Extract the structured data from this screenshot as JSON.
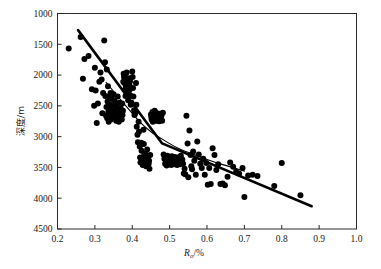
{
  "chart_data": {
    "type": "scatter",
    "title": "",
    "xlabel": "R_o/%",
    "xlabel_main": "R",
    "xlabel_sub": "o",
    "xlabel_tail": "/%",
    "ylabel": "深度/m",
    "xlim": [
      0.2,
      1.0
    ],
    "ylim": [
      1000,
      4500
    ],
    "y_inverted": true,
    "grid": false,
    "legend": "none",
    "xticks": [
      0.2,
      0.3,
      0.4,
      0.5,
      0.6,
      0.7,
      0.8,
      0.9,
      1.0
    ],
    "xticklabels": [
      "0.2",
      "0.3",
      "0.4",
      "0.5",
      "0.6",
      "0.7",
      "0.8",
      "0.9",
      "1.0"
    ],
    "yticks": [
      1000,
      1500,
      2000,
      2500,
      3000,
      3500,
      4000,
      4500
    ],
    "yticklabels": [
      "1000",
      "1500",
      "2000",
      "2500",
      "3000",
      "3500",
      "4000",
      "4500"
    ],
    "marker": {
      "shape": "circle",
      "color": "#000000",
      "size": 3.0
    },
    "series": [
      {
        "name": "samples",
        "x": [
          0.23,
          0.262,
          0.268,
          0.272,
          0.283,
          0.292,
          0.298,
          0.3,
          0.302,
          0.305,
          0.308,
          0.312,
          0.315,
          0.318,
          0.32,
          0.322,
          0.325,
          0.327,
          0.328,
          0.33,
          0.331,
          0.332,
          0.333,
          0.334,
          0.335,
          0.336,
          0.337,
          0.338,
          0.34,
          0.341,
          0.342,
          0.343,
          0.344,
          0.345,
          0.346,
          0.347,
          0.348,
          0.349,
          0.35,
          0.351,
          0.352,
          0.353,
          0.354,
          0.355,
          0.356,
          0.357,
          0.358,
          0.359,
          0.36,
          0.361,
          0.362,
          0.363,
          0.364,
          0.365,
          0.366,
          0.367,
          0.368,
          0.369,
          0.37,
          0.371,
          0.372,
          0.373,
          0.374,
          0.375,
          0.376,
          0.377,
          0.378,
          0.379,
          0.38,
          0.381,
          0.382,
          0.383,
          0.384,
          0.385,
          0.386,
          0.387,
          0.388,
          0.389,
          0.39,
          0.391,
          0.392,
          0.393,
          0.394,
          0.395,
          0.396,
          0.398,
          0.4,
          0.401,
          0.402,
          0.403,
          0.405,
          0.406,
          0.408,
          0.41,
          0.411,
          0.412,
          0.414,
          0.415,
          0.417,
          0.418,
          0.42,
          0.421,
          0.422,
          0.424,
          0.425,
          0.426,
          0.428,
          0.43,
          0.431,
          0.432,
          0.433,
          0.434,
          0.435,
          0.436,
          0.437,
          0.438,
          0.44,
          0.441,
          0.442,
          0.443,
          0.444,
          0.445,
          0.446,
          0.448,
          0.45,
          0.451,
          0.452,
          0.454,
          0.455,
          0.457,
          0.458,
          0.46,
          0.462,
          0.464,
          0.466,
          0.468,
          0.47,
          0.472,
          0.474,
          0.476,
          0.478,
          0.48,
          0.482,
          0.484,
          0.486,
          0.488,
          0.49,
          0.492,
          0.494,
          0.496,
          0.498,
          0.5,
          0.502,
          0.504,
          0.506,
          0.508,
          0.51,
          0.512,
          0.514,
          0.516,
          0.518,
          0.52,
          0.522,
          0.524,
          0.526,
          0.528,
          0.53,
          0.532,
          0.534,
          0.536,
          0.538,
          0.54,
          0.542,
          0.545,
          0.548,
          0.55,
          0.553,
          0.556,
          0.558,
          0.56,
          0.563,
          0.566,
          0.57,
          0.574,
          0.578,
          0.582,
          0.586,
          0.59,
          0.594,
          0.598,
          0.602,
          0.606,
          0.61,
          0.615,
          0.62,
          0.625,
          0.63,
          0.636,
          0.642,
          0.648,
          0.655,
          0.662,
          0.67,
          0.678,
          0.686,
          0.695,
          0.7,
          0.71,
          0.722,
          0.735,
          0.78,
          0.8,
          0.85
        ],
        "y": [
          1570,
          1380,
          2060,
          1740,
          1690,
          2230,
          2500,
          1880,
          2250,
          2780,
          2460,
          2110,
          1960,
          2070,
          2620,
          2290,
          1440,
          1790,
          2340,
          2660,
          2520,
          1910,
          2700,
          2430,
          2180,
          2600,
          2760,
          2350,
          2660,
          2480,
          2290,
          2720,
          2560,
          2640,
          2390,
          2700,
          2530,
          2620,
          2310,
          2680,
          2580,
          2420,
          2700,
          2650,
          2480,
          2740,
          2600,
          2530,
          2660,
          2350,
          2690,
          2580,
          2760,
          2640,
          2450,
          2700,
          2620,
          2540,
          2680,
          2600,
          2720,
          2460,
          2650,
          2580,
          2110,
          1980,
          2030,
          2130,
          2010,
          2240,
          2340,
          2180,
          2070,
          1960,
          2090,
          2260,
          2160,
          2410,
          2300,
          2050,
          2150,
          2240,
          2100,
          2330,
          2480,
          2450,
          1940,
          2030,
          2210,
          2350,
          2570,
          2650,
          2620,
          2130,
          2480,
          2840,
          2970,
          3090,
          2760,
          2920,
          3160,
          3340,
          3420,
          3100,
          3230,
          3390,
          3460,
          2890,
          3120,
          3280,
          3410,
          3350,
          3440,
          3290,
          3480,
          3400,
          3210,
          3380,
          3460,
          3320,
          3440,
          3390,
          3520,
          3300,
          2640,
          2680,
          2720,
          2600,
          2760,
          2650,
          2700,
          2580,
          2660,
          2740,
          2620,
          2710,
          2680,
          2750,
          2630,
          2700,
          2660,
          2740,
          2610,
          3290,
          3360,
          3440,
          3380,
          3470,
          3310,
          3420,
          3350,
          3440,
          3390,
          3460,
          3320,
          3410,
          3370,
          3450,
          3330,
          3420,
          3390,
          3460,
          3340,
          3430,
          3380,
          3450,
          3310,
          3400,
          3370,
          3440,
          3600,
          3520,
          3610,
          2660,
          3110,
          3660,
          2900,
          3300,
          3480,
          3530,
          3240,
          3390,
          3620,
          3080,
          3290,
          3440,
          3510,
          3360,
          3620,
          3430,
          3780,
          3510,
          3770,
          3190,
          3300,
          3540,
          3450,
          3770,
          3760,
          3790,
          3650,
          3420,
          3490,
          3570,
          3600,
          3510,
          3980,
          3630,
          3620,
          3640,
          3800,
          3430,
          3950
        ]
      }
    ],
    "trend_lines": [
      {
        "name": "piecewise-regression-thick",
        "style": "thick-solid",
        "x": [
          0.255,
          0.48,
          0.88
        ],
        "y": [
          1270,
          3110,
          4130
        ]
      },
      {
        "name": "smooth-fit-thin",
        "style": "thin-solid",
        "x": [
          0.33,
          0.38,
          0.42,
          0.45,
          0.48,
          0.52,
          0.56,
          0.6,
          0.64,
          0.68,
          0.7
        ],
        "y": [
          2120,
          2480,
          2760,
          2920,
          3040,
          3180,
          3280,
          3370,
          3450,
          3520,
          3560
        ]
      }
    ]
  }
}
